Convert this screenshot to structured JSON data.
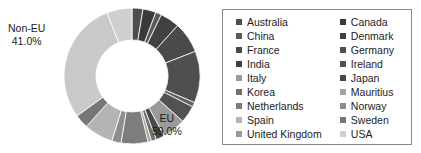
{
  "chart_data": {
    "type": "pie",
    "title": "",
    "subtitle": "",
    "xlabel": "",
    "ylabel": "",
    "variant": "donut",
    "legend_position": "right",
    "grid": false,
    "groups": [
      {
        "name": "EU",
        "value": 59.0,
        "value_label": "59.0%"
      },
      {
        "name": "Non-EU",
        "value": 41.0,
        "value_label": "41.0%"
      }
    ],
    "categories": [
      "Australia",
      "Canada",
      "China",
      "Denmark",
      "France",
      "Germany",
      "India",
      "Ireland",
      "Italy",
      "Japan",
      "Korea",
      "Mauritius",
      "Netherlands",
      "Norway",
      "Spain",
      "Sweden",
      "United Kingdom",
      "USA"
    ],
    "values": [
      2.6,
      3.1,
      1.4,
      4.6,
      7.4,
      12.3,
      1.1,
      4.1,
      5.6,
      2.0,
      1.2,
      0.8,
      6.4,
      2.2,
      6.9,
      3.3,
      29.0,
      6.0
    ],
    "colors": [
      "#4d4d4d",
      "#3a3a3a",
      "#5a5a5a",
      "#414141",
      "#4a4a4a",
      "#4f4f4f",
      "#606060",
      "#525252",
      "#9a9a9a",
      "#484848",
      "#707070",
      "#a3a3a3",
      "#7d7d7d",
      "#8d8d8d",
      "#b4b4b4",
      "#767676",
      "#c9c9c9",
      "#cfcfcf"
    ],
    "segments": [
      {
        "label": "Australia",
        "value": 2.6,
        "color": "#4d4d4d",
        "group": "EU"
      },
      {
        "label": "Canada",
        "value": 3.1,
        "color": "#3a3a3a",
        "group": "EU"
      },
      {
        "label": "China",
        "value": 1.4,
        "color": "#5a5a5a",
        "group": "EU"
      },
      {
        "label": "Denmark",
        "value": 4.6,
        "color": "#414141",
        "group": "EU"
      },
      {
        "label": "France",
        "value": 7.4,
        "color": "#4a4a4a",
        "group": "EU"
      },
      {
        "label": "Germany",
        "value": 12.3,
        "color": "#4f4f4f",
        "group": "EU"
      },
      {
        "label": "India",
        "value": 1.1,
        "color": "#606060",
        "group": "EU"
      },
      {
        "label": "Ireland",
        "value": 4.1,
        "color": "#525252",
        "group": "EU"
      },
      {
        "label": "Italy",
        "value": 5.6,
        "color": "#9a9a9a",
        "group": "EU"
      },
      {
        "label": "Japan",
        "value": 2.0,
        "color": "#484848",
        "group": "EU"
      },
      {
        "label": "Korea",
        "value": 1.2,
        "color": "#707070",
        "group": "EU"
      },
      {
        "label": "Mauritius",
        "value": 0.8,
        "color": "#a3a3a3",
        "group": "Non-EU"
      },
      {
        "label": "Netherlands",
        "value": 6.4,
        "color": "#7d7d7d",
        "group": "Non-EU"
      },
      {
        "label": "Norway",
        "value": 2.2,
        "color": "#8d8d8d",
        "group": "Non-EU"
      },
      {
        "label": "Spain",
        "value": 6.9,
        "color": "#b4b4b4",
        "group": "Non-EU"
      },
      {
        "label": "Sweden",
        "value": 3.3,
        "color": "#767676",
        "group": "Non-EU"
      },
      {
        "label": "United Kingdom",
        "value": 29.0,
        "color": "#c9c9c9",
        "group": "Non-EU"
      },
      {
        "label": "USA",
        "value": 6.0,
        "color": "#cfcfcf",
        "group": "Non-EU"
      }
    ]
  },
  "chart": {
    "labels": {
      "non_eu": {
        "name": "Non-EU",
        "value": "41.0%"
      },
      "eu": {
        "name": "EU",
        "value": "59.0%"
      }
    }
  },
  "legend": {
    "left_column": [
      {
        "label": "Australia",
        "color": "#4d4d4d"
      },
      {
        "label": "China",
        "color": "#5a5a5a"
      },
      {
        "label": "France",
        "color": "#4a4a4a"
      },
      {
        "label": "India",
        "color": "#404040"
      },
      {
        "label": "Italy",
        "color": "#9a9a9a"
      },
      {
        "label": "Korea",
        "color": "#707070"
      },
      {
        "label": "Netherlands",
        "color": "#7d7d7d"
      },
      {
        "label": "Spain",
        "color": "#b4b4b4"
      },
      {
        "label": "United Kingdom",
        "color": "#999999"
      }
    ],
    "right_column": [
      {
        "label": "Canada",
        "color": "#3a3a3a"
      },
      {
        "label": "Denmark",
        "color": "#414141"
      },
      {
        "label": "Germany",
        "color": "#4f4f4f"
      },
      {
        "label": "Ireland",
        "color": "#525252"
      },
      {
        "label": "Japan",
        "color": "#484848"
      },
      {
        "label": "Mauritius",
        "color": "#a3a3a3"
      },
      {
        "label": "Norway",
        "color": "#8d8d8d"
      },
      {
        "label": "Sweden",
        "color": "#767676"
      },
      {
        "label": "USA",
        "color": "#cfcfcf"
      }
    ]
  }
}
